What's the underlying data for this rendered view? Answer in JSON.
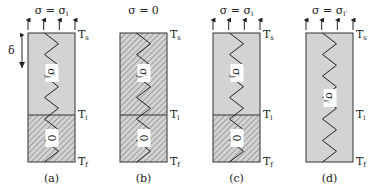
{
  "figure": {
    "panels": [
      {
        "id": "a",
        "caption": "(a)",
        "top_condition": {
          "sigma": "σ",
          "eq": " = ",
          "rhs": "σ",
          "rhs_sub": "i",
          "rhs_prime": ""
        },
        "has_arrows": true,
        "has_delta": true,
        "delta_label": "δ",
        "upper_fill": "#d3d3d3",
        "upper_hatched": false,
        "lower_hatched": true,
        "has_interface": true,
        "upper_label": {
          "main": "σ",
          "sub": "i"
        },
        "lower_label": {
          "main": "0",
          "sub": ""
        },
        "zigzag_full": false,
        "T_labels": {
          "top": "T",
          "top_sub": "s",
          "mid": "T",
          "mid_sub": "i",
          "bot": "T",
          "bot_sub": "f"
        }
      },
      {
        "id": "b",
        "caption": "(b)",
        "top_condition": {
          "sigma": "σ",
          "eq": " = ",
          "rhs": "0",
          "rhs_sub": "",
          "rhs_prime": ""
        },
        "has_arrows": false,
        "has_delta": false,
        "delta_label": "",
        "upper_fill": "#d3d3d3",
        "upper_hatched": true,
        "lower_hatched": true,
        "has_interface": true,
        "upper_label": {
          "main": "σ",
          "sub": "i"
        },
        "lower_label": {
          "main": "0",
          "sub": ""
        },
        "zigzag_full": false,
        "T_labels": {
          "top": "T",
          "top_sub": "s",
          "mid": "T",
          "mid_sub": "i",
          "bot": "T",
          "bot_sub": "f"
        }
      },
      {
        "id": "c",
        "caption": "(c)",
        "top_condition": {
          "sigma": "σ",
          "eq": " = ",
          "rhs": "σ",
          "rhs_sub": "i",
          "rhs_prime": ""
        },
        "has_arrows": true,
        "has_delta": false,
        "delta_label": "",
        "upper_fill": "#d3d3d3",
        "upper_hatched": false,
        "lower_hatched": true,
        "has_interface": true,
        "upper_label": {
          "main": "σ",
          "sub": "i"
        },
        "lower_label": {
          "main": "0",
          "sub": ""
        },
        "zigzag_full": false,
        "T_labels": {
          "top": "T",
          "top_sub": "s",
          "mid": "T",
          "mid_sub": "i",
          "bot": "T",
          "bot_sub": "f"
        }
      },
      {
        "id": "d",
        "caption": "(d)",
        "top_condition": {
          "sigma": "σ",
          "eq": " = ",
          "rhs": "σ",
          "rhs_sub": "i",
          "rhs_prime": "′"
        },
        "has_arrows": true,
        "has_delta": false,
        "delta_label": "",
        "upper_fill": "#d3d3d3",
        "upper_hatched": false,
        "lower_hatched": false,
        "has_interface": false,
        "upper_label": {
          "main": "σ",
          "sub": "i′"
        },
        "lower_label": null,
        "zigzag_full": true,
        "T_labels": {
          "top": "T",
          "top_sub": "s",
          "mid": "T",
          "mid_sub": "i",
          "bot": "T",
          "bot_sub": "f"
        }
      }
    ],
    "colors": {
      "fill": "#d3d3d3",
      "stroke": "#333333",
      "hatch": "#7a7a7a",
      "label_bg": "#ffffff"
    }
  }
}
